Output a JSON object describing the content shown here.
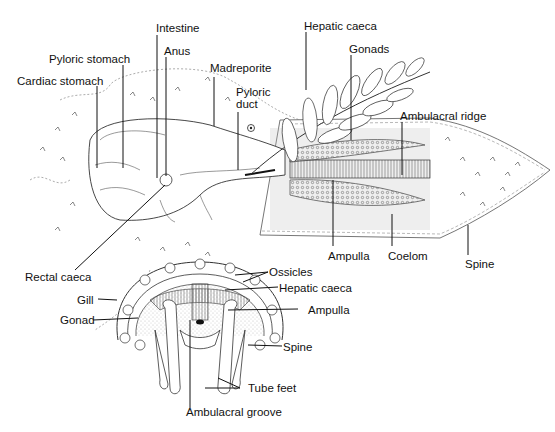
{
  "diagram": {
    "upper_labels": {
      "intestine": "Intestine",
      "pyloric_stomach": "Pyloric stomach",
      "anus": "Anus",
      "cardiac_stomach": "Cardiac stomach",
      "madreporite": "Madreporite",
      "pyloric_duct_line1": "Pyloric",
      "pyloric_duct_line2": "duct",
      "hepatic_caeca": "Hepatic caeca",
      "gonads": "Gonads",
      "ambulacral_ridge": "Ambulacral ridge",
      "ampulla": "Ampulla",
      "coelom": "Coelom",
      "spine": "Spine",
      "rectal_caeca": "Rectal caeca"
    },
    "cross_section_labels": {
      "ossicles": "Ossicles",
      "hepatic_caeca": "Hepatic caeca",
      "ampulla": "Ampulla",
      "gill": "Gill",
      "gonad": "Gonad",
      "spine": "Spine",
      "tube_feet": "Tube feet",
      "ambulacral_groove": "Ambulacral groove"
    }
  }
}
